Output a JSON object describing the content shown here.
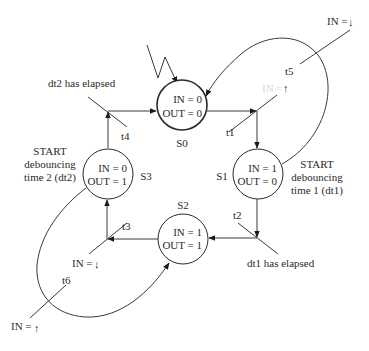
{
  "diagram": {
    "type": "state-machine",
    "states": [
      {
        "id": "S0",
        "name": "S0",
        "line1": "IN = 0",
        "line2": "OUT = 0",
        "initial": true
      },
      {
        "id": "S1",
        "name": "S1",
        "line1": "IN = 1",
        "line2": "OUT = 0"
      },
      {
        "id": "S2",
        "name": "S2",
        "line1": "IN = 1",
        "line2": "OUT = 1"
      },
      {
        "id": "S3",
        "name": "S3",
        "line1": "IN = 0",
        "line2": "OUT = 1"
      }
    ],
    "transitions": [
      {
        "id": "t1",
        "label": "t1",
        "from": "S0",
        "to": "S1",
        "condition": "IN = ↑ (rising)"
      },
      {
        "id": "t2",
        "label": "t2",
        "from": "S1",
        "to": "S2",
        "condition": "dt1 has elapsed"
      },
      {
        "id": "t3",
        "label": "t3",
        "from": "S2",
        "to": "S3",
        "condition": "IN = ↓"
      },
      {
        "id": "t4",
        "label": "t4",
        "from": "S3",
        "to": "S0",
        "condition": "dt2 has elapsed"
      },
      {
        "id": "t5",
        "label": "t5",
        "from": "S1",
        "to": "S0",
        "condition": "IN = ↓"
      },
      {
        "id": "t6",
        "label": "t6",
        "from": "S3",
        "to": "S2",
        "condition": "IN = ↑"
      }
    ],
    "annotations": {
      "s1_action": [
        "START",
        "debouncing",
        "time 1 (dt1)"
      ],
      "s3_action": [
        "START",
        "debouncing",
        "time 2 (dt2)"
      ],
      "t4_condition": "dt2 has elapsed",
      "t2_condition": "dt1 has elapsed",
      "t5_condition_prefix": "IN =",
      "t5_condition_arrow": "↓",
      "t1_condition_prefix": "IN =",
      "t1_condition_arrow": "↑",
      "t3_condition_prefix": "IN =",
      "t3_condition_arrow": "↓",
      "t6_condition_prefix": "IN =",
      "t6_condition_arrow": "↑"
    },
    "colors": {
      "stroke": "#2a2a2a",
      "background": "#ffffff"
    }
  }
}
